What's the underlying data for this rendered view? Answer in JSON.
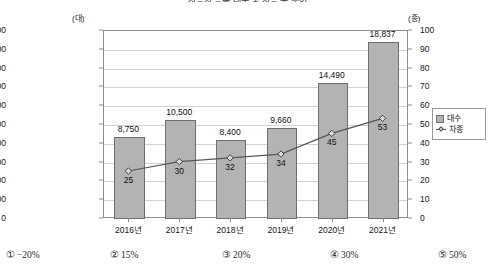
{
  "title": "자동차 등록 대수 및 차종 수 추이",
  "chart_data": {
    "type": "bar",
    "title": "자동차 등록 대수 및 차종 수 추이",
    "categories": [
      "2016년",
      "2017년",
      "2018년",
      "2019년",
      "2020년",
      "2021년"
    ],
    "xlabel": "",
    "ylabel": "(대)",
    "y2label": "(종)",
    "ylim": [
      0,
      20000
    ],
    "y2lim": [
      0,
      100
    ],
    "ytick_step": 2000,
    "y2tick_step": 10,
    "yticks": [
      "0",
      "2,000",
      "4,000",
      "6,000",
      "8,000",
      "10,000",
      "12,000",
      "14,000",
      "16,000",
      "18,000",
      "20,000"
    ],
    "y2ticks": [
      "0",
      "10",
      "20",
      "30",
      "40",
      "50",
      "60",
      "70",
      "80",
      "90",
      "100"
    ],
    "grid": true,
    "legend_position": "right",
    "series": [
      {
        "name": "대수",
        "type": "bar",
        "axis": "left",
        "values": [
          8750,
          10500,
          8400,
          9660,
          14490,
          18837
        ],
        "labels": [
          "8,750",
          "10,500",
          "8,400",
          "9,660",
          "14,490",
          "18,837"
        ],
        "color": "#b3b3b3",
        "edge_color": "#6f6f6f"
      },
      {
        "name": "차종",
        "type": "line",
        "axis": "right",
        "values": [
          25,
          30,
          32,
          34,
          45,
          53
        ],
        "labels": [
          "25",
          "30",
          "32",
          "34",
          "45",
          "53"
        ],
        "color": "#575757",
        "marker": "diamond"
      }
    ]
  },
  "legend": {
    "items": [
      {
        "label": "대수",
        "marker": "square"
      },
      {
        "label": "차종",
        "marker": "diamond"
      }
    ]
  },
  "choices": [
    {
      "num": "①",
      "text": "−20%"
    },
    {
      "num": "②",
      "text": "15%"
    },
    {
      "num": "③",
      "text": "20%"
    },
    {
      "num": "④",
      "text": "30%"
    },
    {
      "num": "⑤",
      "text": "50%"
    }
  ]
}
